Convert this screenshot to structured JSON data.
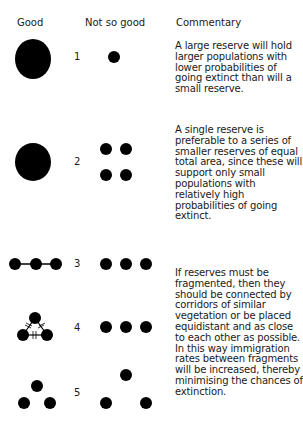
{
  "headers": {
    "good": "Good",
    "not_so_good": "Not so good",
    "commentary": "Commentary"
  },
  "rows": [
    {
      "number": "1",
      "good": "one-large-circle",
      "not_so_good": "one-small-circle"
    },
    {
      "number": "2",
      "good": "one-large-circle",
      "not_so_good": "four-small-circles"
    },
    {
      "number": "3",
      "good": "three-circles-connected-in-line",
      "not_so_good": "three-circles-unconnected-in-line"
    },
    {
      "number": "4",
      "good": "three-circles-triangle-connected-by-corridors",
      "not_so_good": "three-circles-unconnected-in-line"
    },
    {
      "number": "5",
      "good": "three-circles-close-equidistant-triangle",
      "not_so_good": "three-circles-far-apart"
    }
  ],
  "commentary": [
    {
      "lines": [
        "A large reserve will hold",
        "larger populations with",
        "lower probabilities of",
        "going extinct than will a",
        "small reserve."
      ]
    },
    {
      "lines": [
        "A single reserve is",
        "preferable to a series of",
        "smaller reserves of equal",
        "total area, since these will",
        "support only small",
        "populations with",
        "relatively high",
        "probabilities of going",
        "extinct."
      ]
    },
    {
      "lines": [
        "If reserves must be",
        "fragmented, then they",
        "should be connected by",
        "corridors of similar",
        "vegetation or be placed",
        "equidistant and as close",
        "to each other as possible.",
        "In this way immigration",
        "rates between fragments",
        "will be increased, thereby",
        "minimising the chances of",
        "extinction."
      ]
    }
  ],
  "colors": {
    "ink": "#000000",
    "text": "#1a1a1a",
    "background": "#ffffff"
  }
}
